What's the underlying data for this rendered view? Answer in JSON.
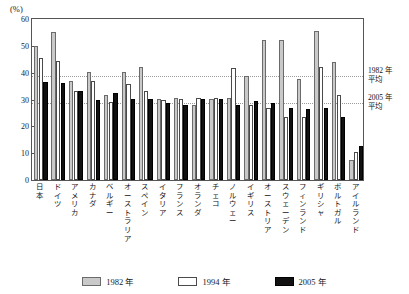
{
  "chart_data": {
    "type": "bar",
    "title": "",
    "subtitle": "",
    "xlabel": "",
    "ylabel": "(%)",
    "ylim": [
      0,
      60
    ],
    "yticks": [
      0,
      10,
      20,
      30,
      40,
      50,
      60
    ],
    "ytick_labels": [
      "0",
      "10",
      "20",
      "30",
      "40",
      "50",
      "60"
    ],
    "grid": false,
    "legend_position": "bottom",
    "categories": [
      "日本",
      "ドイツ",
      "アメリカ",
      "カナダ",
      "ベルギー",
      "オーストラリア",
      "スペイン",
      "イタリア",
      "フランス",
      "オランダ",
      "チェコ",
      "ノルウェー",
      "イギリス",
      "オーストリア",
      "スウェーデン",
      "フィンランド",
      "ギリシャ",
      "ポルトガル",
      "アイルランド"
    ],
    "series": [
      {
        "name": "1982年",
        "color": "#c9c9c9",
        "values": [
          50.0,
          55.0,
          36.8,
          40.3,
          31.5,
          40.2,
          42.3,
          30.3,
          30.4,
          28.0,
          30.3,
          30.4,
          38.6,
          52.0,
          52.0,
          37.8,
          55.5,
          43.9,
          7.6
        ]
      },
      {
        "name": "1994年",
        "color": "#ffffff",
        "values": [
          45.5,
          44.4,
          33.2,
          36.8,
          29.0,
          35.7,
          33.2,
          30.0,
          30.2,
          30.4,
          30.5,
          41.8,
          27.8,
          26.8,
          23.6,
          23.4,
          42.0,
          31.8,
          10.3
        ]
      },
      {
        "name": "2005年",
        "color": "#111111",
        "values": [
          36.5,
          36.3,
          33.2,
          30.0,
          32.6,
          30.1,
          30.1,
          28.8,
          28.0,
          30.3,
          30.2,
          28.0,
          29.3,
          28.7,
          27.0,
          26.5,
          27.0,
          23.3,
          12.8
        ]
      }
    ],
    "reference_lines": [
      {
        "id": "avg-1982",
        "label": "1982 年\n平均",
        "label_line1": "1982 年",
        "label_line2": "平均",
        "value": 38.6,
        "style": "dotted"
      },
      {
        "id": "avg-2005",
        "label": "2005 年\n平均",
        "label_line1": "2005 年",
        "label_line2": "平均",
        "value": 28.6,
        "style": "dotted"
      }
    ]
  },
  "legend": {
    "items": [
      {
        "label": "1982 年",
        "key": "y1982"
      },
      {
        "label": "1994 年",
        "key": "y1994"
      },
      {
        "label": "2005 年",
        "key": "y2005"
      }
    ]
  },
  "axis": {
    "unit": "(%)"
  }
}
